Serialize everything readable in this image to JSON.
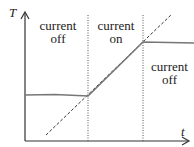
{
  "diagram": {
    "axes": {
      "y_label": "T",
      "x_label": "t"
    },
    "regions": [
      {
        "line1": "current",
        "line2": "off"
      },
      {
        "line1": "current",
        "line2": "on"
      },
      {
        "line1": "current",
        "line2": "off"
      }
    ],
    "colors": {
      "axis": "#333333",
      "curve": "#777777",
      "dashed": "#333333",
      "divider": "#555555"
    }
  }
}
